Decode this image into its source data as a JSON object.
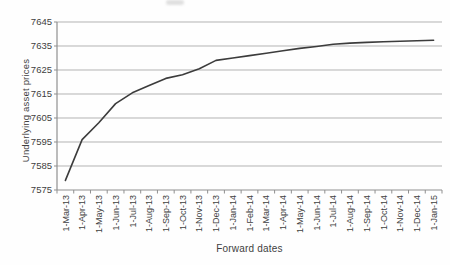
{
  "chart_data": {
    "type": "line",
    "title": "",
    "xlabel": "Forward dates",
    "ylabel": "Underlying asset prices",
    "categories": [
      "1-Mar-13",
      "1-Apr-13",
      "1-May-13",
      "1-Jun-13",
      "1-Jul-13",
      "1-Aug-13",
      "1-Sep-13",
      "1-Oct-13",
      "1-Nov-13",
      "1-Dec-13",
      "1-Jan-14",
      "1-Feb-14",
      "1-Mar-14",
      "1-Apr-14",
      "1-May-14",
      "1-Jun-14",
      "1-Jul-14",
      "1-Aug-14",
      "1-Sep-14",
      "1-Oct-14",
      "1-Nov-14",
      "1-Dec-14",
      "1-Jan-15"
    ],
    "values": [
      7579,
      7596,
      7603,
      7611,
      7615.5,
      7618.5,
      7621.5,
      7623,
      7625.5,
      7629,
      7630,
      7631,
      7632,
      7633,
      7634,
      7634.8,
      7635.7,
      7636.2,
      7636.5,
      7636.8,
      7637,
      7637.2,
      7637.4
    ],
    "ylim": [
      7575,
      7645
    ],
    "yticks": [
      7575,
      7585,
      7595,
      7605,
      7615,
      7625,
      7635,
      7645
    ],
    "grid": "horizontal",
    "legend": "none",
    "line_color": "#3c3c3c",
    "gridline_color": "#b3b3b3",
    "axis_color": "#8f8f8f",
    "text_color": "#3f3f3f"
  }
}
